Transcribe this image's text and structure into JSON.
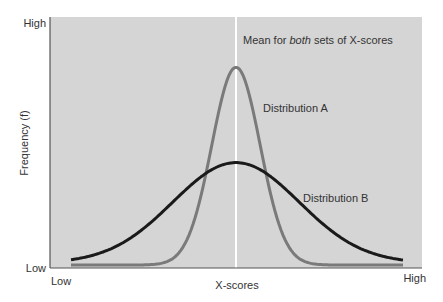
{
  "chart_data": {
    "type": "line",
    "title": "",
    "xlabel": "X-scores",
    "ylabel": "Frequency (f)",
    "x_ticks": [
      "Low",
      "High"
    ],
    "y_ticks": [
      "Low",
      "High"
    ],
    "annotation": {
      "prefix": "Mean for ",
      "emphasis": "both",
      "suffix": " sets of X-scores"
    },
    "mean_x": 0.5,
    "grid": false,
    "series": [
      {
        "name": "Distribution A",
        "color": "#7a7a7a",
        "shape": "normal",
        "mean": 0.5,
        "sd": 0.065,
        "peak": 0.8
      },
      {
        "name": "Distribution B",
        "color": "#1a1a1a",
        "shape": "normal",
        "mean": 0.5,
        "sd": 0.17,
        "peak": 0.42
      }
    ]
  },
  "labels": {
    "y_high": "High",
    "y_low": "Low",
    "x_low": "Low",
    "x_high": "High",
    "x_axis": "X-scores",
    "y_axis": "Frequency (f)",
    "dist_a": "Distribution A",
    "dist_b": "Distribution B",
    "mean_prefix": "Mean for ",
    "mean_em": "both",
    "mean_suffix": " sets of X-scores"
  },
  "colors": {
    "plot_bg": "#d5d5d5",
    "axis": "#555555",
    "mean_line": "#ffffff",
    "dist_a": "#7a7a7a",
    "dist_b": "#1a1a1a"
  }
}
